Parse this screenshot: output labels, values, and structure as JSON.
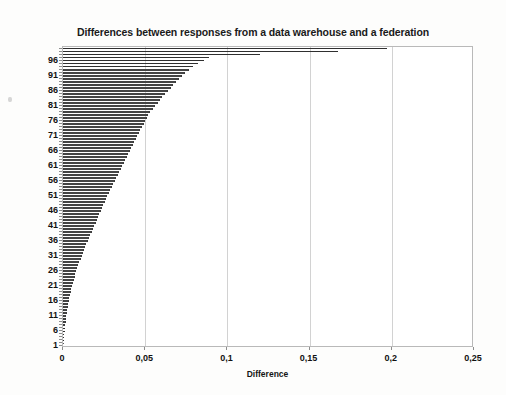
{
  "chart_data": {
    "type": "bar",
    "orientation": "horizontal",
    "title": "Differences between responses from a data warehouse and a federation",
    "xlabel": "Difference",
    "ylabel": "",
    "xlim": [
      0,
      0.25
    ],
    "ylim": [
      1,
      100
    ],
    "grid": "vertical",
    "legend": null,
    "bar_color": "#5a5a5a",
    "decimal_separator": ",",
    "x_tick_labels": [
      "0",
      "0,05",
      "0,1",
      "0,15",
      "0,2",
      "0,25"
    ],
    "x_tick_values": [
      0,
      0.05,
      0.1,
      0.15,
      0.2,
      0.25
    ],
    "y_tick_labels": [
      "1",
      "6",
      "11",
      "16",
      "21",
      "26",
      "31",
      "36",
      "41",
      "46",
      "51",
      "56",
      "61",
      "66",
      "71",
      "76",
      "81",
      "86",
      "91",
      "96"
    ],
    "y_tick_values": [
      1,
      6,
      11,
      16,
      21,
      26,
      31,
      36,
      41,
      46,
      51,
      56,
      61,
      66,
      71,
      76,
      81,
      86,
      91,
      96
    ],
    "categories": [
      1,
      2,
      3,
      4,
      5,
      6,
      7,
      8,
      9,
      10,
      11,
      12,
      13,
      14,
      15,
      16,
      17,
      18,
      19,
      20,
      21,
      22,
      23,
      24,
      25,
      26,
      27,
      28,
      29,
      30,
      31,
      32,
      33,
      34,
      35,
      36,
      37,
      38,
      39,
      40,
      41,
      42,
      43,
      44,
      45,
      46,
      47,
      48,
      49,
      50,
      51,
      52,
      53,
      54,
      55,
      56,
      57,
      58,
      59,
      60,
      61,
      62,
      63,
      64,
      65,
      66,
      67,
      68,
      69,
      70,
      71,
      72,
      73,
      74,
      75,
      76,
      77,
      78,
      79,
      80,
      81,
      82,
      83,
      84,
      85,
      86,
      87,
      88,
      89,
      90,
      91,
      92,
      93,
      94,
      95,
      96,
      97,
      98,
      99,
      100
    ],
    "values": [
      0.0,
      0.0002,
      0.0004,
      0.0006,
      0.0008,
      0.001,
      0.0012,
      0.0014,
      0.0016,
      0.0018,
      0.002,
      0.0023,
      0.0026,
      0.0029,
      0.0032,
      0.0035,
      0.0038,
      0.0042,
      0.0046,
      0.005,
      0.0055,
      0.006,
      0.0065,
      0.007,
      0.0076,
      0.0082,
      0.0088,
      0.0094,
      0.01,
      0.0107,
      0.0114,
      0.0121,
      0.0128,
      0.0135,
      0.0142,
      0.015,
      0.0158,
      0.0166,
      0.0174,
      0.0182,
      0.019,
      0.0198,
      0.0206,
      0.0214,
      0.0222,
      0.023,
      0.0238,
      0.0246,
      0.0254,
      0.0262,
      0.027,
      0.0279,
      0.0288,
      0.0297,
      0.0306,
      0.0315,
      0.0324,
      0.0333,
      0.0342,
      0.0351,
      0.036,
      0.0369,
      0.0378,
      0.0387,
      0.0396,
      0.0405,
      0.0414,
      0.0423,
      0.0432,
      0.0441,
      0.045,
      0.046,
      0.047,
      0.048,
      0.049,
      0.05,
      0.051,
      0.052,
      0.0532,
      0.0545,
      0.056,
      0.0575,
      0.059,
      0.0605,
      0.062,
      0.0638,
      0.0655,
      0.0672,
      0.069,
      0.0708,
      0.0726,
      0.0745,
      0.0765,
      0.079,
      0.082,
      0.0855,
      0.089,
      0.12,
      0.167,
      0.197
    ]
  },
  "figure": {
    "width": 506,
    "height": 395,
    "background": "#ffffff",
    "frame_color": "#b9b9b9",
    "grid_color": "#d2d2d2"
  }
}
